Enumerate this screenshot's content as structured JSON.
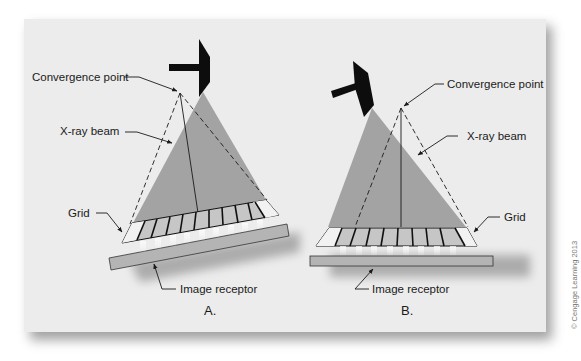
{
  "figure": {
    "copyright": "© Cengage Learning 2013",
    "colors": {
      "panel": "#ececec",
      "beam": "#a3a3a3",
      "tube": "#0d0d0d",
      "receptor": "#b4b4b4",
      "line": "#1a1a1a"
    }
  },
  "panel_a": {
    "caption": "A.",
    "labels": {
      "convergence_point": "Convergence point",
      "xray_beam": "X-ray beam",
      "grid": "Grid",
      "image_receptor": "Image receptor"
    }
  },
  "panel_b": {
    "caption": "B.",
    "labels": {
      "convergence_point": "Convergence point",
      "xray_beam": "X-ray beam",
      "grid": "Grid",
      "image_receptor": "Image receptor"
    }
  }
}
